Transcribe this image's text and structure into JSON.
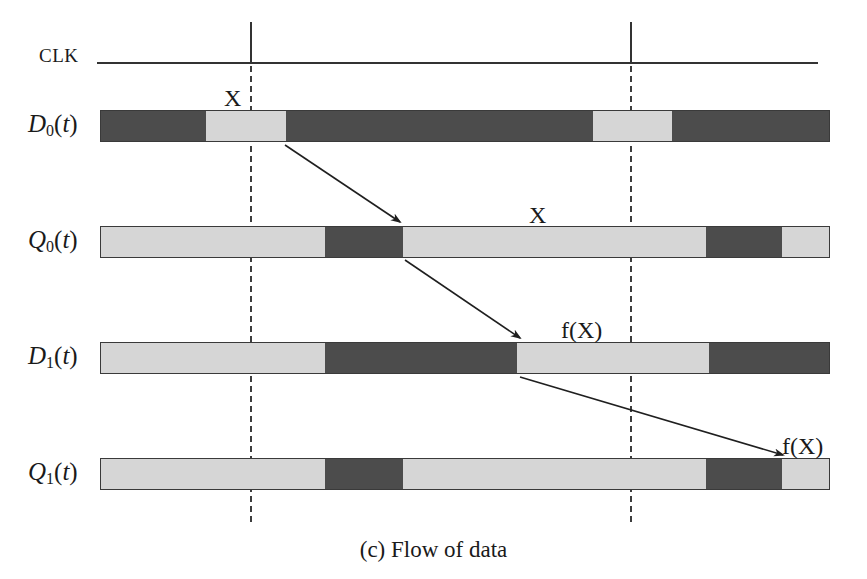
{
  "figure": {
    "caption": "(c) Flow of data",
    "colors": {
      "dark_segment": "#4c4c4c",
      "light_segment": "#d6d6d6",
      "stroke": "#333333",
      "background": "#ffffff"
    }
  },
  "clock": {
    "label": "CLK",
    "baseline_y": 62,
    "line_start_x": 97,
    "line_end_x": 818,
    "edges": [
      {
        "name": "clock-edge-1",
        "x": 250
      },
      {
        "name": "clock-edge-2",
        "x": 630
      }
    ]
  },
  "signals": [
    {
      "name": "D0",
      "label_base": "D",
      "label_sub": "0",
      "label_arg": "(t)",
      "y": 110,
      "height": 32,
      "segments": [
        {
          "state": "dark",
          "x0": 100,
          "x1": 205
        },
        {
          "state": "light",
          "x0": 205,
          "x1": 285
        },
        {
          "state": "dark",
          "x0": 285,
          "x1": 593
        },
        {
          "state": "light",
          "x0": 593,
          "x1": 673
        },
        {
          "state": "dark",
          "x0": 673,
          "x1": 830
        }
      ]
    },
    {
      "name": "Q0",
      "label_base": "Q",
      "label_sub": "0",
      "label_arg": "(t)",
      "y": 226,
      "height": 32,
      "segments": [
        {
          "state": "light",
          "x0": 100,
          "x1": 325
        },
        {
          "state": "dark",
          "x0": 325,
          "x1": 403
        },
        {
          "state": "light",
          "x0": 403,
          "x1": 707
        },
        {
          "state": "dark",
          "x0": 707,
          "x1": 783
        },
        {
          "state": "light",
          "x0": 783,
          "x1": 830
        }
      ]
    },
    {
      "name": "D1",
      "label_base": "D",
      "label_sub": "1",
      "label_arg": "(t)",
      "y": 342,
      "height": 32,
      "segments": [
        {
          "state": "light",
          "x0": 100,
          "x1": 325
        },
        {
          "state": "dark",
          "x0": 325,
          "x1": 517
        },
        {
          "state": "light",
          "x0": 517,
          "x1": 710
        },
        {
          "state": "dark",
          "x0": 710,
          "x1": 830
        }
      ]
    },
    {
      "name": "Q1",
      "label_base": "Q",
      "label_sub": "1",
      "label_arg": "(t)",
      "y": 458,
      "height": 32,
      "segments": [
        {
          "state": "light",
          "x0": 100,
          "x1": 325
        },
        {
          "state": "dark",
          "x0": 325,
          "x1": 403
        },
        {
          "state": "light",
          "x0": 403,
          "x1": 707
        },
        {
          "state": "dark",
          "x0": 707,
          "x1": 783
        },
        {
          "state": "light",
          "x0": 783,
          "x1": 830
        }
      ]
    }
  ],
  "annotations": [
    {
      "name": "annotation-x-on-d0",
      "text": "X",
      "x": 224,
      "y": 86
    },
    {
      "name": "annotation-x-on-q0",
      "text": "X",
      "x": 529,
      "y": 203
    },
    {
      "name": "annotation-fx-on-d1",
      "text": "f(X)",
      "x": 561,
      "y": 318
    },
    {
      "name": "annotation-fx-on-q1",
      "text": "f(X)",
      "x": 782,
      "y": 434
    }
  ],
  "flow_arrows": [
    {
      "name": "arrow-d0-to-q0",
      "x1": 285,
      "y1": 145,
      "x2": 400,
      "y2": 222
    },
    {
      "name": "arrow-q0-to-d1",
      "x1": 405,
      "y1": 260,
      "x2": 520,
      "y2": 338
    },
    {
      "name": "arrow-d1-to-q1",
      "x1": 520,
      "y1": 377,
      "x2": 783,
      "y2": 455
    }
  ]
}
